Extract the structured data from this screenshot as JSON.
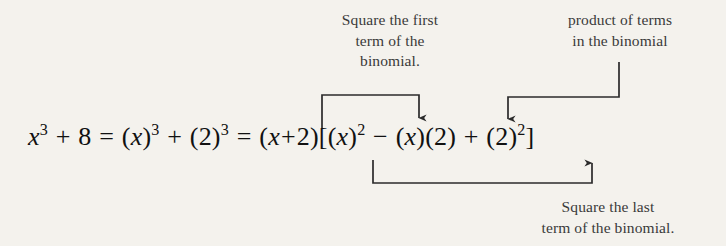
{
  "figure": {
    "type": "annotated-equation",
    "background_color": "#f4f2ed",
    "text_color": "#1a1a1a",
    "line_color": "#2b2b2b",
    "equation_plain": "x^3 + 8 = (x)^3 + (2)^3 = (x + 2)[(x)^2 - (x)(2) + (2)^2]",
    "equation_parts": {
      "lhs_base": "x",
      "lhs_exponent": "3",
      "plus": "+",
      "constant": "8",
      "equals": "=",
      "first_cube_open": "(",
      "first_cube_var": "x",
      "first_cube_close": ")",
      "first_cube_exp": "3",
      "second_cube_open": "(",
      "second_cube_num": "2",
      "second_cube_close": ")",
      "second_cube_exp": "3",
      "binomial": "(x + 2)",
      "bracket_open": "[",
      "sq_first_open": "(",
      "sq_first_var": "x",
      "sq_first_close": ")",
      "sq_first_exp": "2",
      "minus": "−",
      "prod_first": "(x)",
      "prod_second": "(2)",
      "sq_last_open": "(",
      "sq_last_num": "2",
      "sq_last_close": ")",
      "sq_last_exp": "2",
      "bracket_close": "]"
    }
  },
  "annotations": {
    "square_first_term": {
      "label": "Square the first\nterm of the\nbinomial.",
      "points_to": "(x)^2"
    },
    "product_of_terms": {
      "label": "product of terms\nin the binomial",
      "points_to": "(x)(2)"
    },
    "square_last_term": {
      "label": "Square the last\nterm of the binomial.",
      "points_to": "(2)^2"
    }
  }
}
